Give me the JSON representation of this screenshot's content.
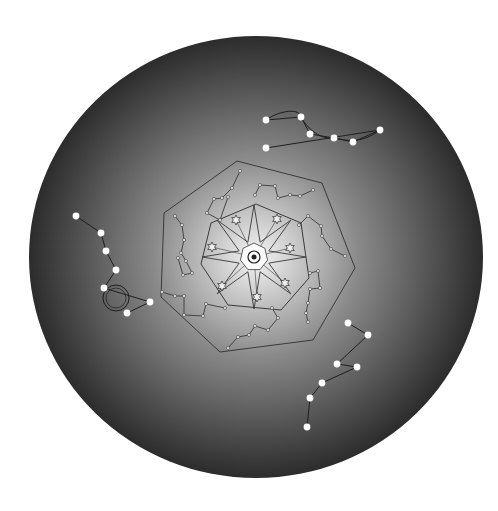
{
  "canvas": {
    "width": 498,
    "height": 511,
    "background": "#ffffff"
  },
  "disk": {
    "cx": 256,
    "cy": 257,
    "rx": 227,
    "ry": 221,
    "center_color": "#f4f4f4",
    "mid_color": "#8a8a8a",
    "edge_color": "#2c2c2c"
  },
  "colors": {
    "line": "#3a3a3a",
    "star_fill": "#ffffff",
    "node": "#555555"
  },
  "outer_heptagon": [
    [
      237,
      161
    ],
    [
      322,
      183
    ],
    [
      355,
      268
    ],
    [
      313,
      340
    ],
    [
      220,
      352
    ],
    [
      161,
      297
    ],
    [
      164,
      213
    ]
  ],
  "inner_heptagon": [
    [
      256,
      204
    ],
    [
      301,
      223
    ],
    [
      309,
      278
    ],
    [
      281,
      310
    ],
    [
      228,
      305
    ],
    [
      201,
      264
    ],
    [
      211,
      223
    ]
  ],
  "center": {
    "x": 254,
    "y": 257,
    "hub_radius": 14,
    "ring_radius": 6,
    "dot_radius": 2.5
  },
  "central_star": {
    "points": 8,
    "outer_radius": 52,
    "inner_radius": 16,
    "rotation_deg": -90
  },
  "small_stars": [
    [
      236,
      220
    ],
    [
      277,
      219
    ],
    [
      290,
      248
    ],
    [
      285,
      283
    ],
    [
      257,
      297
    ],
    [
      222,
      286
    ],
    [
      212,
      247
    ]
  ],
  "inner_dipper_constellations": [
    [
      [
        240,
        171
      ],
      [
        232,
        188
      ],
      [
        222,
        198
      ],
      [
        214,
        199
      ],
      [
        207,
        213
      ],
      [
        220,
        220
      ],
      [
        228,
        197
      ]
    ],
    [
      [
        255,
        195
      ],
      [
        260,
        185
      ],
      [
        275,
        186
      ],
      [
        278,
        198
      ],
      [
        290,
        195
      ],
      [
        300,
        196
      ],
      [
        313,
        190
      ]
    ],
    [
      [
        299,
        225
      ],
      [
        308,
        216
      ],
      [
        321,
        226
      ],
      [
        322,
        236
      ],
      [
        331,
        249
      ],
      [
        345,
        256
      ]
    ],
    [
      [
        310,
        273
      ],
      [
        318,
        271
      ],
      [
        320,
        288
      ],
      [
        310,
        289
      ],
      [
        308,
        303
      ],
      [
        306,
        313
      ],
      [
        308,
        322
      ]
    ],
    [
      [
        272,
        308
      ],
      [
        278,
        318
      ],
      [
        268,
        330
      ],
      [
        255,
        326
      ],
      [
        249,
        335
      ],
      [
        238,
        337
      ],
      [
        228,
        348
      ]
    ],
    [
      [
        225,
        308
      ],
      [
        206,
        304
      ],
      [
        203,
        316
      ],
      [
        184,
        315
      ],
      [
        184,
        296
      ],
      [
        175,
        296
      ],
      [
        162,
        292
      ]
    ],
    [
      [
        175,
        216
      ],
      [
        182,
        225
      ],
      [
        184,
        240
      ],
      [
        181,
        253
      ],
      [
        186,
        261
      ],
      [
        192,
        273
      ],
      [
        183,
        275
      ],
      [
        178,
        258
      ]
    ]
  ],
  "bright_constellations": [
    {
      "name": "upper-right",
      "stars": [
        [
          266,
          120
        ],
        [
          301,
          117
        ],
        [
          310,
          134
        ],
        [
          334,
          138
        ],
        [
          353,
          142
        ],
        [
          380,
          130
        ],
        [
          266,
          148
        ]
      ],
      "outline": "M266,120 C280,110 300,108 301,117 C305,125 318,140 334,138 C345,140 360,145 380,130"
    },
    {
      "name": "left",
      "stars": [
        [
          76,
          216
        ],
        [
          101,
          233
        ],
        [
          106,
          251
        ],
        [
          116,
          270
        ],
        [
          104,
          288
        ],
        [
          150,
          302
        ],
        [
          127,
          313
        ]
      ],
      "wheel": {
        "cx": 116,
        "cy": 298,
        "r": 13
      }
    },
    {
      "name": "lower-right",
      "stars": [
        [
          348,
          323
        ],
        [
          368,
          335
        ],
        [
          337,
          364
        ],
        [
          357,
          367
        ],
        [
          322,
          383
        ],
        [
          310,
          398
        ],
        [
          307,
          427
        ]
      ]
    }
  ]
}
